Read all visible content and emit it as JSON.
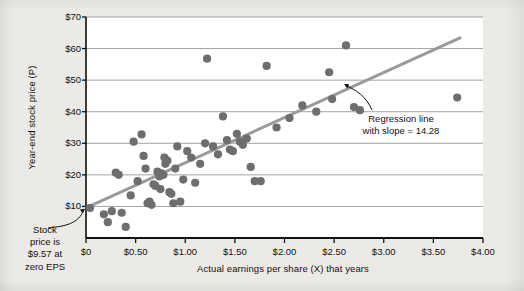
{
  "figure": {
    "background_color": "#eceae6",
    "plot_background_color": "#ffffff"
  },
  "chart_data": {
    "type": "scatter",
    "title": "",
    "xlabel": "Actual earnings per share (X) that years",
    "ylabel": "Year-end stock price (P)",
    "xlim": [
      0,
      4.0
    ],
    "ylim": [
      0,
      70
    ],
    "xticks": [
      0,
      0.5,
      1.0,
      1.5,
      2.0,
      2.5,
      3.0,
      3.5,
      4.0
    ],
    "xticklabels": [
      "$0",
      "$0.50",
      "$1.00",
      "$1.50",
      "$2.00",
      "$2.50",
      "$3.00",
      "$3.50",
      "$4.00"
    ],
    "yticks": [
      10,
      20,
      30,
      40,
      50,
      60,
      70
    ],
    "yticklabels": [
      "$10",
      "$20",
      "$30",
      "$40",
      "$50",
      "$60",
      "$70"
    ],
    "grid": "horizontal",
    "legend": "none",
    "marker_color": "#6e6e6e",
    "marker_size": 7,
    "regression_line": {
      "slope": 14.28,
      "intercept": 9.57,
      "color": "#9a9a9a",
      "width": 3,
      "x_start": 0.0,
      "x_end": 3.78
    },
    "x": [
      0.04,
      0.18,
      0.22,
      0.26,
      0.3,
      0.33,
      0.36,
      0.4,
      0.45,
      0.48,
      0.52,
      0.56,
      0.58,
      0.6,
      0.62,
      0.64,
      0.66,
      0.68,
      0.7,
      0.72,
      0.74,
      0.75,
      0.76,
      0.78,
      0.79,
      0.8,
      0.82,
      0.84,
      0.86,
      0.88,
      0.9,
      0.92,
      0.95,
      0.98,
      1.02,
      1.06,
      1.1,
      1.15,
      1.2,
      1.22,
      1.28,
      1.33,
      1.38,
      1.42,
      1.45,
      1.48,
      1.52,
      1.55,
      1.58,
      1.62,
      1.66,
      1.7,
      1.76,
      1.82,
      1.92,
      2.05,
      2.18,
      2.32,
      2.45,
      2.48,
      2.62,
      2.7,
      2.76,
      3.74
    ],
    "y": [
      9.5,
      7.5,
      5.0,
      8.5,
      20.7,
      20.0,
      8.0,
      3.5,
      13.5,
      30.5,
      18.0,
      32.8,
      26.0,
      22.0,
      11.0,
      11.5,
      10.5,
      17.0,
      16.5,
      21.0,
      19.5,
      15.5,
      20.5,
      20.0,
      25.5,
      23.5,
      24.5,
      14.5,
      14.0,
      11.0,
      22.0,
      29.0,
      11.5,
      18.5,
      27.5,
      25.5,
      17.5,
      23.5,
      30.0,
      56.8,
      29.0,
      26.5,
      38.5,
      31.0,
      28.0,
      27.5,
      33.0,
      30.5,
      29.5,
      31.5,
      22.5,
      18.0,
      18.0,
      54.5,
      35.0,
      38.0,
      42.0,
      40.0,
      52.5,
      44.0,
      61.0,
      41.5,
      40.5,
      44.5
    ]
  },
  "annotations": {
    "intercept": {
      "line1": "Stock",
      "line2": "price is",
      "line3": "$9.57 at",
      "line4": "zero EPS"
    },
    "regression": {
      "line1": "Regression line",
      "line2": "with slope = 14.28"
    }
  }
}
